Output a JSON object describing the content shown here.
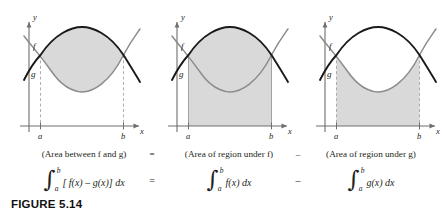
{
  "figure": {
    "caption": "FIGURE 5.14",
    "panels": [
      {
        "id": "area-between",
        "y_axis_label": "y",
        "x_axis_label": "x",
        "curve_labels": {
          "upper": "f",
          "lower": "g"
        },
        "tick_labels": {
          "left": "a",
          "right": "b"
        },
        "shaded_description": "region between f and g",
        "guide_style": "dashed"
      },
      {
        "id": "area-under-f",
        "y_axis_label": "y",
        "x_axis_label": "x",
        "curve_labels": {
          "upper": "f",
          "lower": "g"
        },
        "tick_labels": {
          "left": "a",
          "right": "b"
        },
        "shaded_description": "region under f",
        "guide_style": "solid"
      },
      {
        "id": "area-under-g",
        "y_axis_label": "y",
        "x_axis_label": "x",
        "curve_labels": {
          "upper": "f",
          "lower": "g"
        },
        "tick_labels": {
          "left": "a",
          "right": "b"
        },
        "shaded_description": "region under g",
        "guide_style": "dashed"
      }
    ],
    "word_equation": {
      "term1": "(Area between f and g)",
      "operator1": "=",
      "term2": "(Area of region under f)",
      "operator2": "–",
      "term3": "(Area of region under g)"
    },
    "integral_equation": {
      "term1": {
        "lower": "a",
        "upper": "b",
        "body": "[ f(x) – g(x)] dx"
      },
      "operator1": "=",
      "term2": {
        "lower": "a",
        "upper": "b",
        "body": "f(x) dx"
      },
      "operator2": "–",
      "term3": {
        "lower": "a",
        "upper": "b",
        "body": "g(x) dx"
      }
    },
    "colors": {
      "shading": "#d9d9d9",
      "curve_f": "#1a1a1a",
      "curve_g": "#8c8c8c",
      "axis": "#6e6e6e",
      "text": "#231f20"
    }
  }
}
